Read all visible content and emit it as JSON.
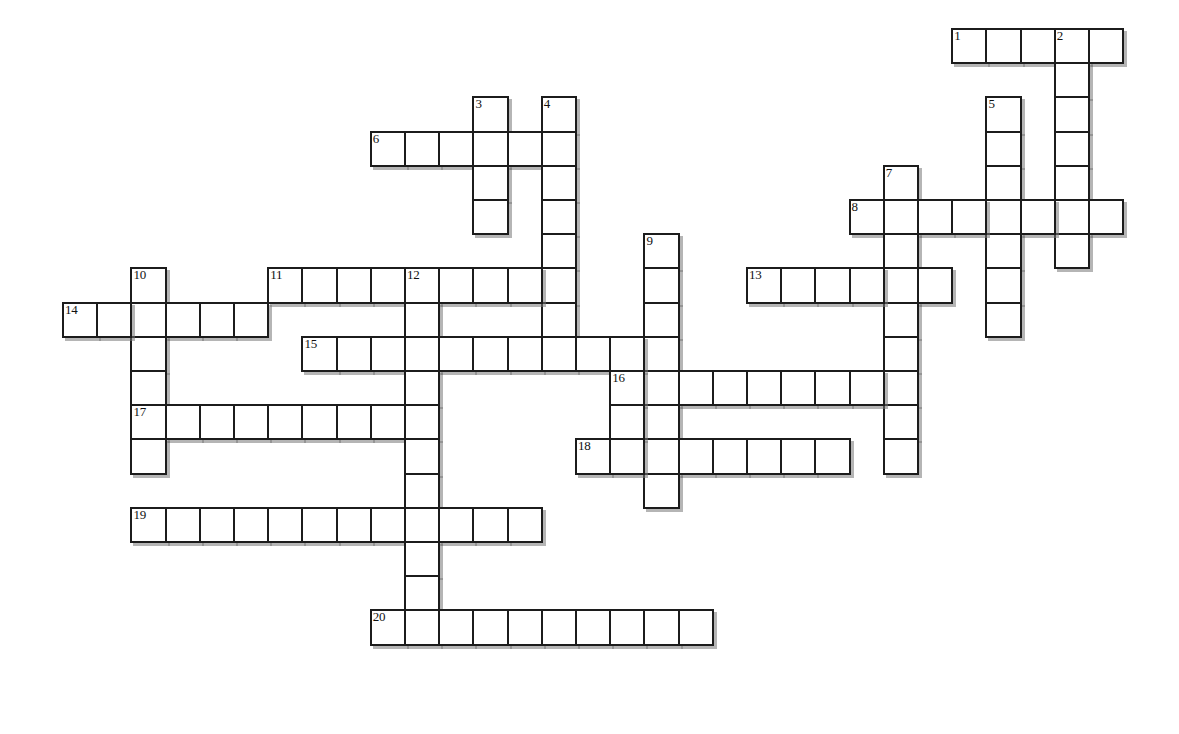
{
  "puzzle": {
    "title": "Crossword Puzzle Grid",
    "grid_origin_x": 62,
    "grid_origin_y": 28,
    "cell_size": 34.2,
    "cell_border_color": "#1c1c1c",
    "cell_fill_color": "#ffffff",
    "shadow_color": "#787878",
    "background_color": "#ffffff",
    "columns": 33,
    "rows": 21,
    "numbered_clue_count": 20,
    "entries": [
      {
        "number": "1",
        "direction": "across",
        "row": 0,
        "col": 26,
        "length": 5
      },
      {
        "number": "2",
        "direction": "down",
        "row": 0,
        "col": 29,
        "length": 7
      },
      {
        "number": "3",
        "direction": "down",
        "row": 2,
        "col": 12,
        "length": 4
      },
      {
        "number": "4",
        "direction": "down",
        "row": 2,
        "col": 14,
        "length": 7
      },
      {
        "number": "5",
        "direction": "down",
        "row": 2,
        "col": 27,
        "length": 7
      },
      {
        "number": "6",
        "direction": "across",
        "row": 3,
        "col": 9,
        "length": 6
      },
      {
        "number": "7",
        "direction": "down",
        "row": 4,
        "col": 24,
        "length": 9
      },
      {
        "number": "8",
        "direction": "across",
        "row": 5,
        "col": 23,
        "length": 8
      },
      {
        "number": "9",
        "direction": "down",
        "row": 6,
        "col": 17,
        "length": 8
      },
      {
        "number": "10",
        "direction": "down",
        "row": 7,
        "col": 2,
        "length": 7
      },
      {
        "number": "11",
        "direction": "across",
        "row": 7,
        "col": 6,
        "length": 9
      },
      {
        "number": "12",
        "direction": "down",
        "row": 7,
        "col": 10,
        "length": 11
      },
      {
        "number": "13",
        "direction": "across",
        "row": 7,
        "col": 20,
        "length": 6
      },
      {
        "number": "14",
        "direction": "across",
        "row": 8,
        "col": 0,
        "length": 6
      },
      {
        "number": "15",
        "direction": "across",
        "row": 9,
        "col": 7,
        "length": 10
      },
      {
        "number": "16",
        "direction": "across",
        "row": 10,
        "col": 16,
        "length": 8
      },
      {
        "number": "17",
        "direction": "across",
        "row": 11,
        "col": 2,
        "length": 8
      },
      {
        "number": "18",
        "direction": "across",
        "row": 12,
        "col": 15,
        "length": 8
      },
      {
        "number": "19",
        "direction": "across",
        "row": 14,
        "col": 2,
        "length": 12
      },
      {
        "number": "20",
        "direction": "across",
        "row": 17,
        "col": 9,
        "length": 10
      }
    ],
    "cells": [
      {
        "row": 0,
        "col": 26,
        "num": "1"
      },
      {
        "row": 0,
        "col": 27,
        "num": ""
      },
      {
        "row": 0,
        "col": 28,
        "num": ""
      },
      {
        "row": 0,
        "col": 29,
        "num": "2"
      },
      {
        "row": 0,
        "col": 30,
        "num": ""
      },
      {
        "row": 1,
        "col": 29,
        "num": ""
      },
      {
        "row": 2,
        "col": 29,
        "num": ""
      },
      {
        "row": 3,
        "col": 29,
        "num": ""
      },
      {
        "row": 4,
        "col": 29,
        "num": ""
      },
      {
        "row": 5,
        "col": 29,
        "num": ""
      },
      {
        "row": 6,
        "col": 29,
        "num": ""
      },
      {
        "row": 2,
        "col": 12,
        "num": "3"
      },
      {
        "row": 2,
        "col": 14,
        "num": "4"
      },
      {
        "row": 2,
        "col": 27,
        "num": "5"
      },
      {
        "row": 3,
        "col": 9,
        "num": "6"
      },
      {
        "row": 3,
        "col": 10,
        "num": ""
      },
      {
        "row": 3,
        "col": 11,
        "num": ""
      },
      {
        "row": 3,
        "col": 12,
        "num": ""
      },
      {
        "row": 3,
        "col": 13,
        "num": ""
      },
      {
        "row": 3,
        "col": 14,
        "num": ""
      },
      {
        "row": 3,
        "col": 27,
        "num": ""
      },
      {
        "row": 4,
        "col": 27,
        "num": ""
      },
      {
        "row": 5,
        "col": 27,
        "num": ""
      },
      {
        "row": 6,
        "col": 27,
        "num": ""
      },
      {
        "row": 7,
        "col": 27,
        "num": ""
      },
      {
        "row": 8,
        "col": 27,
        "num": ""
      },
      {
        "row": 4,
        "col": 12,
        "num": ""
      },
      {
        "row": 5,
        "col": 12,
        "num": ""
      },
      {
        "row": 4,
        "col": 14,
        "num": ""
      },
      {
        "row": 5,
        "col": 14,
        "num": ""
      },
      {
        "row": 6,
        "col": 14,
        "num": ""
      },
      {
        "row": 7,
        "col": 14,
        "num": ""
      },
      {
        "row": 8,
        "col": 14,
        "num": ""
      },
      {
        "row": 4,
        "col": 24,
        "num": "7"
      },
      {
        "row": 5,
        "col": 23,
        "num": "8"
      },
      {
        "row": 5,
        "col": 24,
        "num": ""
      },
      {
        "row": 5,
        "col": 25,
        "num": ""
      },
      {
        "row": 5,
        "col": 26,
        "num": ""
      },
      {
        "row": 5,
        "col": 27,
        "num": ""
      },
      {
        "row": 5,
        "col": 28,
        "num": ""
      },
      {
        "row": 5,
        "col": 29,
        "num": ""
      },
      {
        "row": 5,
        "col": 30,
        "num": ""
      },
      {
        "row": 6,
        "col": 24,
        "num": ""
      },
      {
        "row": 7,
        "col": 24,
        "num": ""
      },
      {
        "row": 8,
        "col": 24,
        "num": ""
      },
      {
        "row": 9,
        "col": 24,
        "num": ""
      },
      {
        "row": 10,
        "col": 24,
        "num": ""
      },
      {
        "row": 11,
        "col": 24,
        "num": ""
      },
      {
        "row": 12,
        "col": 24,
        "num": ""
      },
      {
        "row": 6,
        "col": 17,
        "num": "9"
      },
      {
        "row": 7,
        "col": 17,
        "num": ""
      },
      {
        "row": 8,
        "col": 17,
        "num": ""
      },
      {
        "row": 9,
        "col": 17,
        "num": ""
      },
      {
        "row": 10,
        "col": 17,
        "num": ""
      },
      {
        "row": 11,
        "col": 17,
        "num": ""
      },
      {
        "row": 12,
        "col": 17,
        "num": ""
      },
      {
        "row": 13,
        "col": 17,
        "num": ""
      },
      {
        "row": 7,
        "col": 2,
        "num": "10"
      },
      {
        "row": 8,
        "col": 2,
        "num": ""
      },
      {
        "row": 9,
        "col": 2,
        "num": ""
      },
      {
        "row": 10,
        "col": 2,
        "num": ""
      },
      {
        "row": 11,
        "col": 2,
        "num": "17"
      },
      {
        "row": 12,
        "col": 2,
        "num": ""
      },
      {
        "row": 7,
        "col": 6,
        "num": "11"
      },
      {
        "row": 7,
        "col": 7,
        "num": ""
      },
      {
        "row": 7,
        "col": 8,
        "num": ""
      },
      {
        "row": 7,
        "col": 9,
        "num": ""
      },
      {
        "row": 7,
        "col": 10,
        "num": "12"
      },
      {
        "row": 7,
        "col": 11,
        "num": ""
      },
      {
        "row": 7,
        "col": 12,
        "num": ""
      },
      {
        "row": 7,
        "col": 13,
        "num": ""
      },
      {
        "row": 7,
        "col": 14,
        "num": ""
      },
      {
        "row": 7,
        "col": 20,
        "num": "13"
      },
      {
        "row": 7,
        "col": 21,
        "num": ""
      },
      {
        "row": 7,
        "col": 22,
        "num": ""
      },
      {
        "row": 7,
        "col": 23,
        "num": ""
      },
      {
        "row": 7,
        "col": 24,
        "num": ""
      },
      {
        "row": 7,
        "col": 25,
        "num": ""
      },
      {
        "row": 8,
        "col": 0,
        "num": "14"
      },
      {
        "row": 8,
        "col": 1,
        "num": ""
      },
      {
        "row": 8,
        "col": 2,
        "num": ""
      },
      {
        "row": 8,
        "col": 3,
        "num": ""
      },
      {
        "row": 8,
        "col": 4,
        "num": ""
      },
      {
        "row": 8,
        "col": 5,
        "num": ""
      },
      {
        "row": 8,
        "col": 10,
        "num": ""
      },
      {
        "row": 9,
        "col": 7,
        "num": "15"
      },
      {
        "row": 9,
        "col": 8,
        "num": ""
      },
      {
        "row": 9,
        "col": 9,
        "num": ""
      },
      {
        "row": 9,
        "col": 10,
        "num": ""
      },
      {
        "row": 9,
        "col": 11,
        "num": ""
      },
      {
        "row": 9,
        "col": 12,
        "num": ""
      },
      {
        "row": 9,
        "col": 13,
        "num": ""
      },
      {
        "row": 9,
        "col": 14,
        "num": ""
      },
      {
        "row": 9,
        "col": 15,
        "num": ""
      },
      {
        "row": 9,
        "col": 16,
        "num": ""
      },
      {
        "row": 10,
        "col": 10,
        "num": ""
      },
      {
        "row": 10,
        "col": 16,
        "num": "16"
      },
      {
        "row": 10,
        "col": 18,
        "num": ""
      },
      {
        "row": 10,
        "col": 19,
        "num": ""
      },
      {
        "row": 10,
        "col": 20,
        "num": ""
      },
      {
        "row": 10,
        "col": 21,
        "num": ""
      },
      {
        "row": 10,
        "col": 22,
        "num": ""
      },
      {
        "row": 10,
        "col": 23,
        "num": ""
      },
      {
        "row": 11,
        "col": 3,
        "num": ""
      },
      {
        "row": 11,
        "col": 4,
        "num": ""
      },
      {
        "row": 11,
        "col": 5,
        "num": ""
      },
      {
        "row": 11,
        "col": 6,
        "num": ""
      },
      {
        "row": 11,
        "col": 7,
        "num": ""
      },
      {
        "row": 11,
        "col": 8,
        "num": ""
      },
      {
        "row": 11,
        "col": 9,
        "num": ""
      },
      {
        "row": 11,
        "col": 10,
        "num": ""
      },
      {
        "row": 11,
        "col": 16,
        "num": ""
      },
      {
        "row": 12,
        "col": 10,
        "num": ""
      },
      {
        "row": 12,
        "col": 15,
        "num": "18"
      },
      {
        "row": 12,
        "col": 16,
        "num": ""
      },
      {
        "row": 12,
        "col": 18,
        "num": ""
      },
      {
        "row": 12,
        "col": 19,
        "num": ""
      },
      {
        "row": 12,
        "col": 20,
        "num": ""
      },
      {
        "row": 12,
        "col": 21,
        "num": ""
      },
      {
        "row": 12,
        "col": 22,
        "num": ""
      },
      {
        "row": 13,
        "col": 10,
        "num": ""
      },
      {
        "row": 14,
        "col": 2,
        "num": "19"
      },
      {
        "row": 14,
        "col": 3,
        "num": ""
      },
      {
        "row": 14,
        "col": 4,
        "num": ""
      },
      {
        "row": 14,
        "col": 5,
        "num": ""
      },
      {
        "row": 14,
        "col": 6,
        "num": ""
      },
      {
        "row": 14,
        "col": 7,
        "num": ""
      },
      {
        "row": 14,
        "col": 8,
        "num": ""
      },
      {
        "row": 14,
        "col": 9,
        "num": ""
      },
      {
        "row": 14,
        "col": 10,
        "num": ""
      },
      {
        "row": 14,
        "col": 11,
        "num": ""
      },
      {
        "row": 14,
        "col": 12,
        "num": ""
      },
      {
        "row": 14,
        "col": 13,
        "num": ""
      },
      {
        "row": 15,
        "col": 10,
        "num": ""
      },
      {
        "row": 16,
        "col": 10,
        "num": ""
      },
      {
        "row": 17,
        "col": 9,
        "num": "20"
      },
      {
        "row": 17,
        "col": 10,
        "num": ""
      },
      {
        "row": 17,
        "col": 11,
        "num": ""
      },
      {
        "row": 17,
        "col": 12,
        "num": ""
      },
      {
        "row": 17,
        "col": 13,
        "num": ""
      },
      {
        "row": 17,
        "col": 14,
        "num": ""
      },
      {
        "row": 17,
        "col": 15,
        "num": ""
      },
      {
        "row": 17,
        "col": 16,
        "num": ""
      },
      {
        "row": 17,
        "col": 17,
        "num": ""
      },
      {
        "row": 17,
        "col": 18,
        "num": ""
      }
    ]
  }
}
